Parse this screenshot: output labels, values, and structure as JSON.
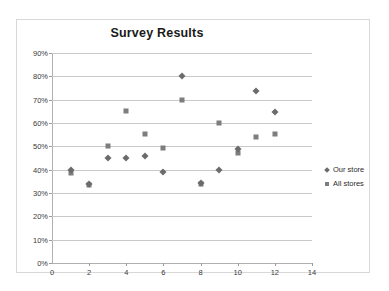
{
  "chart_data": {
    "type": "scatter",
    "title": "Survey Results",
    "xlabel": "",
    "ylabel": "",
    "xlim": [
      0,
      14
    ],
    "ylim": [
      0,
      0.9
    ],
    "grid": true,
    "legend_position": "right",
    "x_ticks": [
      "0",
      "2",
      "4",
      "6",
      "8",
      "10",
      "12",
      "14"
    ],
    "x_tick_values": [
      0,
      2,
      4,
      6,
      8,
      10,
      12,
      14
    ],
    "y_ticks": [
      "0%",
      "10%",
      "20%",
      "30%",
      "40%",
      "50%",
      "60%",
      "70%",
      "80%",
      "90%"
    ],
    "y_tick_values": [
      0,
      10,
      20,
      30,
      40,
      50,
      60,
      70,
      80,
      90
    ],
    "x": [
      1,
      2,
      3,
      4,
      5,
      6,
      7,
      8,
      9,
      10,
      11,
      12
    ],
    "series": [
      {
        "name": "Our store",
        "marker": "diamond",
        "color": "#6b6b6b",
        "values": [
          40,
          34,
          45,
          45,
          46,
          39,
          80,
          34.5,
          40,
          48.8,
          73.6,
          64.6
        ]
      },
      {
        "name": "All stores",
        "marker": "square",
        "color": "#7d7d7d",
        "values": [
          38.5,
          33.5,
          50.2,
          65,
          55.2,
          49.3,
          70,
          34,
          60.2,
          47.2,
          54,
          55.2
        ]
      }
    ]
  },
  "legend": {
    "items": [
      {
        "label": "Our store",
        "marker": "diamond"
      },
      {
        "label": "All stores",
        "marker": "square"
      }
    ]
  },
  "colors": {
    "series_our_store": "#6b6b6b",
    "series_all_stores": "#7d7d7d",
    "gridline": "#c9c9c9",
    "axis": "#b0b0b0",
    "frame_border": "#d8d8d8",
    "text": "#3a3a3a",
    "title": "#1a1a1a"
  }
}
